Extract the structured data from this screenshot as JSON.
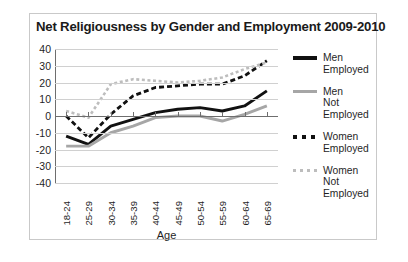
{
  "chart_data": {
    "type": "line",
    "title": "Net Religiousness by Gender and Employment 2009-2010",
    "xlabel": "Age",
    "ylabel": "",
    "categories": [
      "18-24",
      "25-29",
      "30-34",
      "35-39",
      "40-44",
      "45-49",
      "50-54",
      "55-59",
      "60-64",
      "65-69"
    ],
    "ylim": [
      -40,
      40
    ],
    "yticks": [
      40,
      30,
      20,
      10,
      0,
      -10,
      -20,
      -30,
      -40
    ],
    "grid": true,
    "legend_position": "right",
    "series": [
      {
        "name": "Men Employed",
        "label_line1": "Men",
        "label_line2": "Employed",
        "color": "#111111",
        "style": "solid",
        "values": [
          -12,
          -17,
          -6,
          -2,
          2,
          4,
          5,
          3,
          6,
          15
        ]
      },
      {
        "name": "Men Not Employed",
        "label_line1": "Men",
        "label_line2": "Not Employed",
        "color": "#a6a6a6",
        "style": "solid",
        "values": [
          -18,
          -18,
          -10,
          -6,
          -1,
          0,
          0,
          -3,
          1,
          6
        ]
      },
      {
        "name": "Women Employed",
        "label_line1": "Women",
        "label_line2": "Employed",
        "color": "#111111",
        "style": "dashed",
        "values": [
          0,
          -13,
          1,
          12,
          17,
          18,
          19,
          19,
          24,
          33
        ]
      },
      {
        "name": "Women Not Employed",
        "label_line1": "Women",
        "label_line2": "Not Employed",
        "color": "#bdbdbd",
        "style": "dotted",
        "values": [
          3,
          -1,
          19,
          22,
          21,
          20,
          21,
          23,
          28,
          32
        ]
      }
    ]
  }
}
